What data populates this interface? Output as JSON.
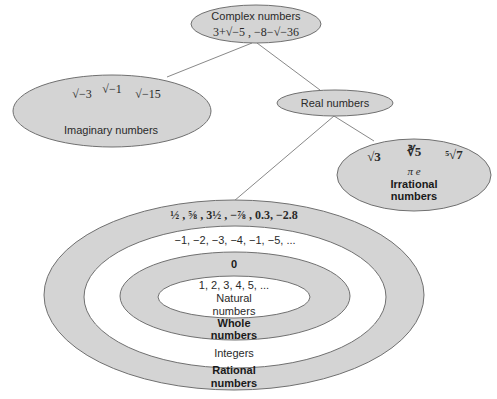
{
  "diagram": {
    "nodes": {
      "complex": {
        "label": "Complex numbers",
        "examples": "3+√−5 , −8−√−36"
      },
      "imaginary": {
        "label": "Imaginary numbers",
        "examples": [
          "√−3",
          "√−1",
          "√−15"
        ]
      },
      "real": {
        "label": "Real numbers"
      },
      "irrational": {
        "label_line1": "Irrational",
        "label_line2": "numbers",
        "examples": [
          "√3",
          "∛5",
          "⁵√7"
        ],
        "constants": "π e"
      },
      "rational": {
        "label_line1": "Rational",
        "label_line2": "numbers",
        "examples": "½ , ⅝ , 3½ , −⅞ , 0.3, −2.8"
      },
      "integers": {
        "label": "Integers",
        "examples": "−1, −2, −3, −4, −1, −5, ..."
      },
      "whole": {
        "label_line1": "Whole",
        "label_line2": "numbers",
        "examples": "0"
      },
      "natural": {
        "label_line1": "Natural",
        "label_line2": "numbers",
        "examples": "1, 2, 3, 4, 5, ..."
      }
    },
    "edges": [
      {
        "from": "complex",
        "to": "imaginary"
      },
      {
        "from": "complex",
        "to": "real"
      },
      {
        "from": "real",
        "to": "irrational"
      },
      {
        "from": "real",
        "to": "rational"
      }
    ],
    "colors": {
      "fill_gray": "#d4d4d4",
      "fill_white": "#ffffff",
      "stroke": "#707070"
    }
  }
}
